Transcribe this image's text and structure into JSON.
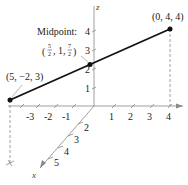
{
  "diagram": {
    "type": "3d-coordinate-line-segment",
    "axes": {
      "x": {
        "label": "x",
        "ticks": [
          "2",
          "3",
          "4",
          "5"
        ]
      },
      "y": {
        "label": "y",
        "ticks": [
          "-3",
          "-2",
          "-1",
          "1",
          "2",
          "3",
          "4"
        ]
      },
      "z": {
        "label": "z",
        "ticks": [
          "1",
          "2",
          "3",
          "4"
        ]
      }
    },
    "points": {
      "endpoint_a": {
        "label": "(5, −2, 3)"
      },
      "endpoint_b": {
        "label": "(0, 4, 4)"
      },
      "midpoint": {
        "title": "Midpoint:",
        "open_paren": "(",
        "close_paren": ")",
        "x_num": "5",
        "x_den": "2",
        "y": "1",
        "z_num": "7",
        "z_den": "2",
        "sep": ","
      }
    },
    "colors": {
      "line": "#111111",
      "axis": "#777777",
      "dashed": "#888888"
    }
  }
}
